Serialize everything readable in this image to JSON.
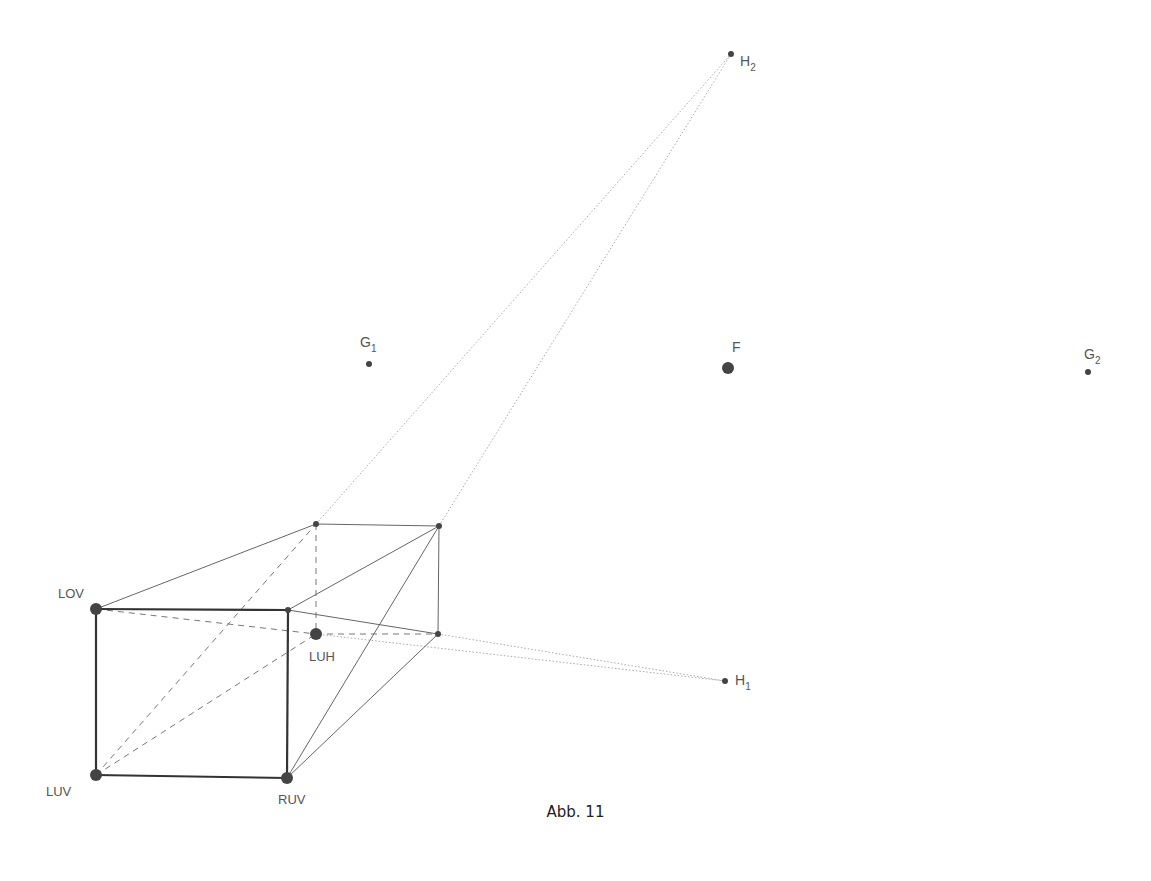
{
  "caption": "Abb. 11",
  "colors": {
    "front_edge": "#333333",
    "edge": "#666666",
    "hidden_edge": "#777777",
    "construction_line": "#aaaaaa",
    "point": "#444444",
    "label": "#555555"
  },
  "points": {
    "H2": {
      "label": "H",
      "sub": "2",
      "x": 731,
      "y": 54
    },
    "G1": {
      "label": "G",
      "sub": "1",
      "x": 369,
      "y": 364
    },
    "F": {
      "label": "F",
      "sub": "",
      "x": 728,
      "y": 368
    },
    "G2": {
      "label": "G",
      "sub": "2",
      "x": 1088,
      "y": 372
    },
    "H1": {
      "label": "H",
      "sub": "1",
      "x": 725,
      "y": 681
    },
    "LOV": {
      "label": "LOV",
      "x": 96,
      "y": 609
    },
    "LUV": {
      "label": "LUV",
      "x": 96,
      "y": 775
    },
    "RUV": {
      "label": "RUV",
      "x": 287,
      "y": 778
    },
    "LUH": {
      "label": "LUH",
      "x": 316,
      "y": 634
    },
    "ROV": {
      "x": 288,
      "y": 610
    },
    "LOH": {
      "x": 316,
      "y": 524
    },
    "ROH": {
      "x": 439,
      "y": 526
    },
    "RUH": {
      "x": 438,
      "y": 634
    }
  }
}
